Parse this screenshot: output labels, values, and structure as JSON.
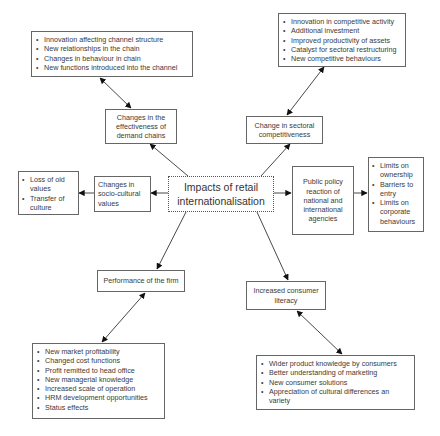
{
  "diagram": {
    "center": {
      "label": "Impacts of retail internationalisation"
    },
    "nodes": {
      "demand_chains": {
        "label": "Changes in the effectiveness of demand chains"
      },
      "sectoral": {
        "label": "Change in sectoral competitiveness"
      },
      "socio_cultural": {
        "label": "Changes in socio-cultural values"
      },
      "public_policy": {
        "label": "Public policy reaction of national and international agencies"
      },
      "performance": {
        "label": "Performance of the firm"
      },
      "consumer": {
        "label": "Increased consumer literacy"
      }
    },
    "lists": {
      "demand_chains": [
        "Innovation affecting channel structure",
        "New relationships in the chain",
        "Changes in behaviour in chain",
        "New functions introduced into the channel"
      ],
      "sectoral": [
        "Innovation in competitive activity",
        "Additional investment",
        "Improved productivity of assets",
        "Catalyst for sectoral restructuring",
        "New competitive behaviours"
      ],
      "socio_cultural": [
        "Loss of old values",
        "Transfer of culture"
      ],
      "public_policy": [
        "Limits on ownership",
        "Barriers to entry",
        "Limits on corporate behaviours"
      ],
      "performance": [
        "New market profitability",
        "Changed cost functions",
        "Profit remitted to head office",
        "New managerial knowledge",
        "Increased scale of operation",
        "HRM development opportunities",
        "Status effects"
      ],
      "consumer": [
        "Wider product knowledge by consumers",
        "Better understanding of marketing",
        "New consumer solutions",
        "Appreciation of cultural differences an variety"
      ]
    }
  }
}
